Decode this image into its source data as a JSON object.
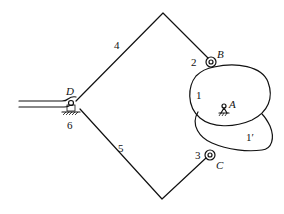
{
  "diagram": {
    "type": "mechanism-linkage",
    "labels": {
      "D": "D",
      "B": "B",
      "C": "C",
      "A": "A",
      "link_4": "4",
      "link_5": "5",
      "link_2": "2",
      "link_3": "3",
      "cam_1": "1",
      "cam_1p": "1′",
      "frame_6": "6"
    },
    "points": {
      "D": [
        76,
        104
      ],
      "apex_top": [
        163,
        13
      ],
      "apex_bottom": [
        162,
        199
      ],
      "B": [
        211,
        62
      ],
      "C": [
        210,
        155
      ],
      "A": [
        226,
        105
      ]
    },
    "colors": {
      "stroke": "#111111",
      "background": "#ffffff"
    }
  }
}
